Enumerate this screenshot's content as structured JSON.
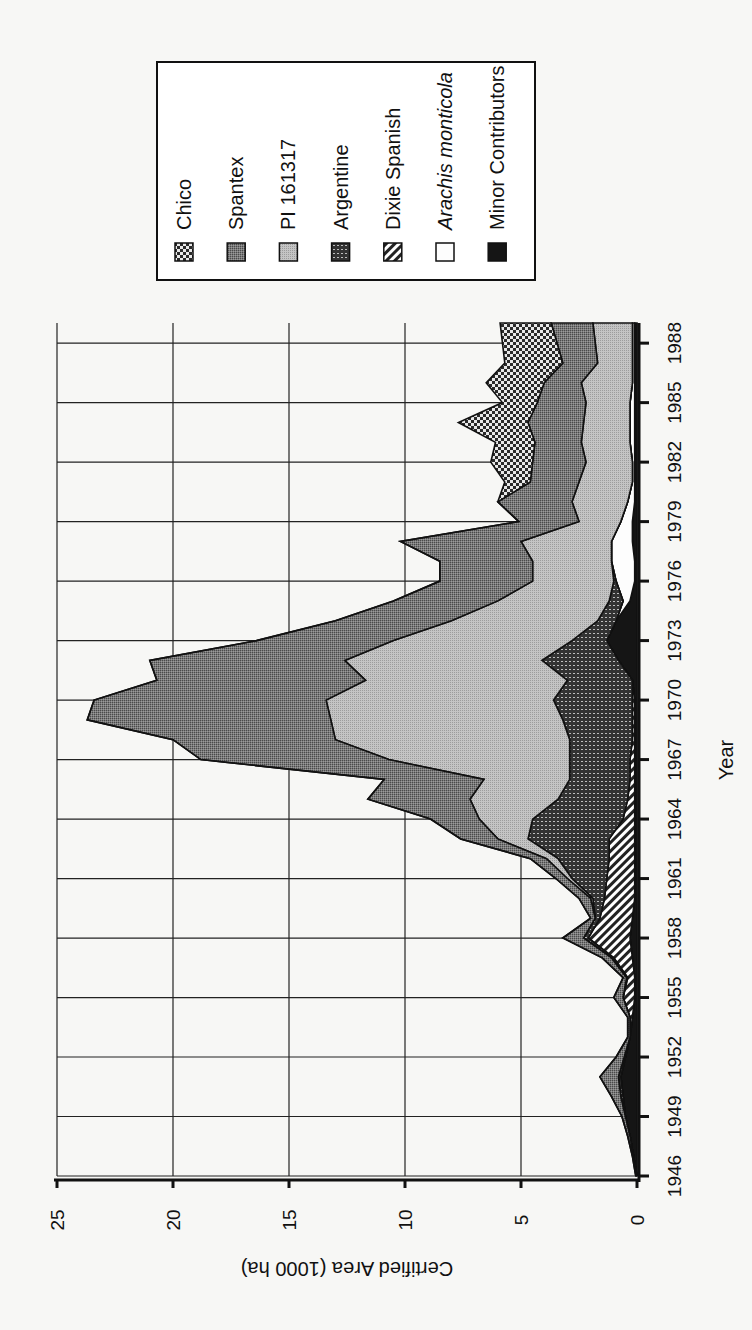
{
  "chart_data": {
    "type": "area",
    "stacked": true,
    "orientation": "rotated-90-ccw",
    "title": "",
    "xlabel": "Year",
    "ylabel": "Certified Area (1000 ha)",
    "ylim": [
      0,
      25
    ],
    "yticks": [
      0,
      5,
      10,
      15,
      20,
      25
    ],
    "xticks": [
      1946,
      1949,
      1952,
      1955,
      1958,
      1961,
      1964,
      1967,
      1970,
      1973,
      1976,
      1979,
      1982,
      1985,
      1988
    ],
    "grid": true,
    "legend_position": "upper-right (top of rotated page)",
    "x": [
      1946,
      1947,
      1948,
      1949,
      1950,
      1951,
      1952,
      1953,
      1954,
      1955,
      1956,
      1957,
      1958,
      1959,
      1960,
      1961,
      1962,
      1963,
      1964,
      1965,
      1966,
      1967,
      1968,
      1969,
      1970,
      1971,
      1972,
      1973,
      1974,
      1975,
      1976,
      1977,
      1978,
      1979,
      1980,
      1981,
      1982,
      1983,
      1984,
      1985,
      1986,
      1987,
      1988
    ],
    "series": [
      {
        "name": "Minor Contributors",
        "pattern": "solid-black",
        "values": [
          0,
          0.15,
          0.3,
          0.5,
          0.6,
          0.7,
          0.5,
          0.3,
          0.2,
          0.1,
          0.1,
          0.2,
          0.3,
          0.2,
          0.1,
          0.1,
          0.1,
          0.1,
          0.1,
          0.1,
          0.1,
          0.1,
          0.1,
          0.1,
          0.1,
          0.2,
          0.8,
          1.3,
          0.9,
          0.3,
          0.1,
          0.1,
          0.2,
          0.2,
          0.1,
          0.1,
          0.1,
          0.1,
          0.1,
          0.1,
          0.1,
          0.1,
          0.1
        ]
      },
      {
        "name": "Arachis monticola",
        "pattern": "white",
        "italic": true,
        "values": [
          0,
          0,
          0,
          0,
          0,
          0,
          0,
          0,
          0,
          0,
          0,
          0,
          0,
          0,
          0,
          0,
          0,
          0,
          0,
          0,
          0,
          0,
          0,
          0,
          0,
          0,
          0,
          0,
          0,
          0.3,
          0.8,
          1.0,
          0.9,
          0.5,
          0.3,
          0.1,
          0.1,
          0.2,
          0.2,
          0.2,
          0.1,
          0.1,
          0.1
        ]
      },
      {
        "name": "Dixie Spanish",
        "pattern": "diagonal-hatch",
        "values": [
          0,
          0,
          0,
          0,
          0,
          0,
          0,
          0,
          0.1,
          0.5,
          0.3,
          0.8,
          1.8,
          1.4,
          1.3,
          1.2,
          1.1,
          1.1,
          0.5,
          0.3,
          0.2,
          0.2,
          0.1,
          0.1,
          0.1,
          0,
          0,
          0,
          0,
          0,
          0,
          0,
          0,
          0,
          0,
          0,
          0,
          0,
          0,
          0,
          0,
          0,
          0
        ]
      },
      {
        "name": "Argentine",
        "pattern": "dark-dotted",
        "values": [
          0,
          0,
          0,
          0,
          0.1,
          0.1,
          0.05,
          0,
          0,
          0,
          0.05,
          0.1,
          0.2,
          0.2,
          0.5,
          1.5,
          2.2,
          3.5,
          3.9,
          3.0,
          2.6,
          2.6,
          2.7,
          3.0,
          3.4,
          2.8,
          3.3,
          1.5,
          0.8,
          0.6,
          0.1,
          0,
          0,
          0,
          0,
          0,
          0,
          0,
          0,
          0,
          0,
          0,
          0
        ]
      },
      {
        "name": "PI 161317",
        "pattern": "light-stipple",
        "values": [
          0,
          0,
          0,
          0,
          0,
          0,
          0,
          0,
          0,
          0,
          0,
          0,
          0,
          0,
          0.1,
          0.2,
          0.5,
          1.3,
          2.3,
          3.8,
          3.7,
          7.8,
          10.1,
          10.0,
          9.8,
          8.7,
          8.5,
          7.7,
          6.3,
          4.8,
          3.5,
          3.4,
          3.9,
          1.8,
          2.4,
          2.3,
          2.0,
          2.1,
          2.0,
          1.9,
          2.2,
          1.5,
          1.7
        ]
      },
      {
        "name": "Spantex",
        "pattern": "medium-stipple",
        "values": [
          0.05,
          0.05,
          0.1,
          0.15,
          0.4,
          0.8,
          0.35,
          0.1,
          0.1,
          0.4,
          0.15,
          0.4,
          0.9,
          0.2,
          0.5,
          0.5,
          0.7,
          1.6,
          2.1,
          4.4,
          4.3,
          8.1,
          7.0,
          10.5,
          10.0,
          9.0,
          8.4,
          5.9,
          5.0,
          4.5,
          4.0,
          4.0,
          5.2,
          2.6,
          3.2,
          2.1,
          2.3,
          2.0,
          2.4,
          2.1,
          1.6,
          1.5,
          1.8
        ]
      },
      {
        "name": "Chico",
        "pattern": "checker",
        "values": [
          0,
          0,
          0,
          0,
          0,
          0,
          0,
          0,
          0,
          0,
          0,
          0,
          0,
          0,
          0,
          0,
          0,
          0,
          0,
          0,
          0,
          0,
          0,
          0,
          0,
          0,
          0,
          0,
          0,
          0,
          0,
          0,
          0,
          0,
          0,
          1.1,
          1.8,
          1.7,
          3.0,
          1.5,
          2.5,
          2.5,
          2.2
        ]
      }
    ]
  },
  "axes": {
    "x_title": "Year",
    "y_title": "Certified Area (1000 ha)",
    "y_tick_labels": [
      "0",
      "5",
      "10",
      "15",
      "20",
      "25"
    ],
    "x_tick_labels": [
      "1946",
      "1949",
      "1952",
      "1955",
      "1958",
      "1961",
      "1964",
      "1967",
      "1970",
      "1973",
      "1976",
      "1979",
      "1982",
      "1985",
      "1988"
    ]
  },
  "legend": {
    "items": [
      {
        "label": "Chico",
        "pattern": "checker"
      },
      {
        "label": "Spantex",
        "pattern": "medium-stipple"
      },
      {
        "label": "PI 161317",
        "pattern": "light-stipple"
      },
      {
        "label": "Argentine",
        "pattern": "dark-dotted"
      },
      {
        "label": "Dixie Spanish",
        "pattern": "diagonal-hatch"
      },
      {
        "label": "Arachis monticola",
        "pattern": "white",
        "italic": true
      },
      {
        "label": "Minor Contributors",
        "pattern": "solid-black"
      }
    ]
  }
}
